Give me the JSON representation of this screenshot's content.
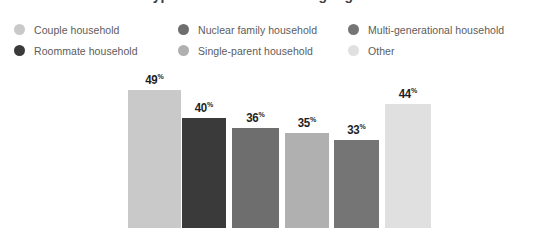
{
  "title": "Types of households living together",
  "legend": {
    "columns": [
      {
        "items": [
          {
            "label": "Couple household",
            "color": "#c9c9c9"
          },
          {
            "label": "Roommate household",
            "color": "#3a3a3a"
          }
        ]
      },
      {
        "items": [
          {
            "label": "Nuclear family household",
            "color": "#6e6e6e"
          },
          {
            "label": "Single-parent household",
            "color": "#b0b0b0"
          }
        ]
      },
      {
        "items": [
          {
            "label": "Multi-generational household",
            "color": "#757575"
          },
          {
            "label": "Other",
            "color": "#e0e0e0"
          }
        ]
      }
    ]
  },
  "chart_data": {
    "type": "bar",
    "title": "Types of households living together",
    "xlabel": "",
    "ylabel": "",
    "ylim": [
      0,
      55
    ],
    "grid": false,
    "legend_position": "top",
    "value_suffix": "%",
    "categories": [
      "Couple household",
      "Roommate household",
      "Nuclear family household",
      "Single-parent household",
      "Multi-generational household",
      "Other"
    ],
    "values": [
      49,
      40,
      36,
      35,
      33,
      44
    ],
    "value_labels": [
      "49",
      "40",
      "36",
      "35",
      "33",
      "44"
    ],
    "colors": [
      "#c9c9c9",
      "#3a3a3a",
      "#6e6e6e",
      "#b0b0b0",
      "#757575",
      "#e0e0e0"
    ],
    "bars": [
      {
        "category": "Couple household",
        "label": "49",
        "value": 49,
        "color": "#c9c9c9",
        "x": 128,
        "width": 53,
        "top": 90
      },
      {
        "category": "Roommate household",
        "label": "40",
        "value": 40,
        "color": "#3a3a3a",
        "x": 182,
        "width": 44,
        "top": 118
      },
      {
        "category": "Nuclear family household",
        "label": "36",
        "value": 36,
        "color": "#6e6e6e",
        "x": 232,
        "width": 47,
        "top": 128
      },
      {
        "category": "Single-parent household",
        "label": "35",
        "value": 35,
        "color": "#b0b0b0",
        "x": 285,
        "width": 44,
        "top": 133
      },
      {
        "category": "Multi-generational household",
        "label": "33",
        "value": 33,
        "color": "#757575",
        "x": 334,
        "width": 45,
        "top": 140
      },
      {
        "category": "Other",
        "label": "44",
        "value": 44,
        "color": "#e0e0e0",
        "x": 385,
        "width": 46,
        "top": 104
      }
    ]
  }
}
